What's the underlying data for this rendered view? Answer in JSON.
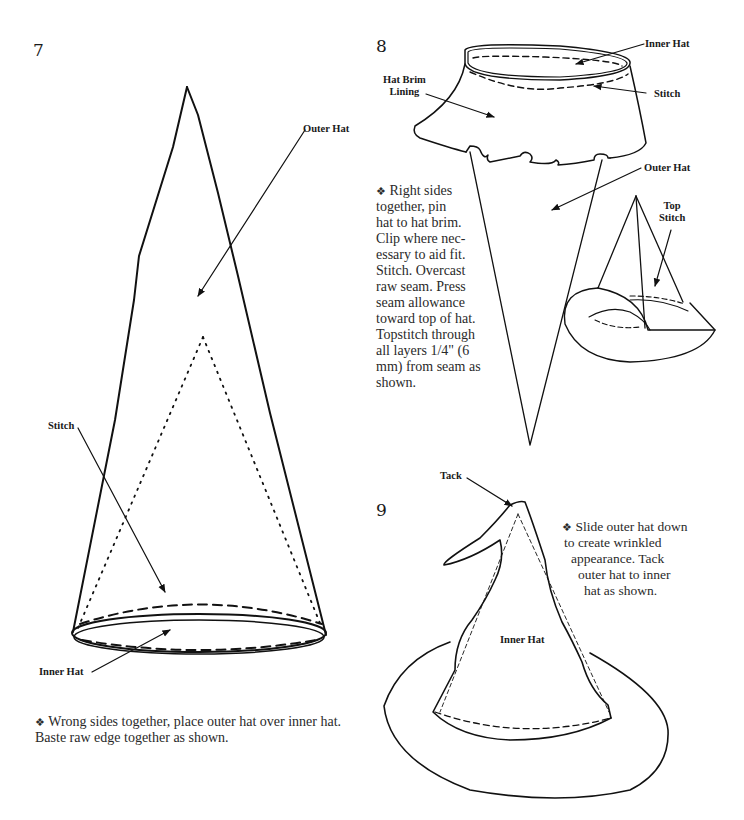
{
  "steps": [
    {
      "number": "7",
      "labels": {
        "outer_hat": "Outer Hat",
        "stitch": "Stitch",
        "inner_hat": "Inner Hat"
      },
      "bullet": "❖",
      "instruction_line1": "Wrong sides together, place outer hat over inner hat.",
      "instruction_line2": "Baste raw edge together as shown."
    },
    {
      "number": "8",
      "labels": {
        "inner_hat": "Inner Hat",
        "hat_brim_lining_1": "Hat Brim",
        "hat_brim_lining_2": "Lining",
        "stitch": "Stitch",
        "outer_hat": "Outer Hat",
        "top_stitch_1": "Top",
        "top_stitch_2": "Stitch"
      },
      "bullet": "❖",
      "instruction_lines": [
        "Right sides",
        "together, pin",
        "hat to hat brim.",
        "Clip where nec-",
        "essary to aid fit.",
        "Stitch. Overcast",
        "raw seam. Press",
        "seam allowance",
        "toward top of hat.",
        "Topstitch through",
        "all layers 1/4\" (6",
        "mm) from seam as",
        "shown."
      ]
    },
    {
      "number": "9",
      "labels": {
        "tack": "Tack",
        "inner_hat": "Inner Hat"
      },
      "bullet": "❖",
      "instruction_lines": [
        "Slide outer hat down",
        "to create wrinkled",
        "appearance. Tack",
        "outer hat to inner",
        "hat as shown."
      ]
    }
  ]
}
